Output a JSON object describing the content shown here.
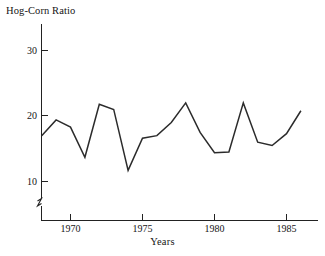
{
  "chart_data": {
    "type": "line",
    "title": "Hog-Corn Ratio",
    "xlabel": "Years",
    "ylabel": "",
    "x": [
      1968,
      1969,
      1970,
      1971,
      1972,
      1973,
      1974,
      1975,
      1976,
      1977,
      1978,
      1979,
      1980,
      1981,
      1982,
      1983,
      1984,
      1985,
      1986
    ],
    "values": [
      17.0,
      19.4,
      18.3,
      13.7,
      21.8,
      21.0,
      11.7,
      16.6,
      17.0,
      19.0,
      22.0,
      17.5,
      14.4,
      14.5,
      22.0,
      16.0,
      15.5,
      17.3,
      20.8
    ],
    "series": [
      {
        "name": "Hog-Corn Ratio",
        "values": [
          17.0,
          19.4,
          18.3,
          13.7,
          21.8,
          21.0,
          11.7,
          16.6,
          17.0,
          19.0,
          22.0,
          17.5,
          14.4,
          14.5,
          22.0,
          16.0,
          15.5,
          17.3,
          20.8
        ]
      }
    ],
    "xlim": [
      1968,
      1987.5
    ],
    "ylim": [
      8,
      33
    ],
    "ytick_labels": [
      "10",
      "20",
      "30"
    ],
    "yticks": [
      10,
      20,
      30
    ],
    "xtick_labels": [
      "1970",
      "1975",
      "1980",
      "1985"
    ],
    "xticks": [
      1970,
      1975,
      1980,
      1985
    ],
    "grid": false,
    "legend": false,
    "axis_break": true,
    "line_color": "#2b2b2b",
    "background_color": "#ffffff"
  },
  "axes": {
    "y_axis_name": "y-axis",
    "x_axis_name": "x-axis"
  }
}
